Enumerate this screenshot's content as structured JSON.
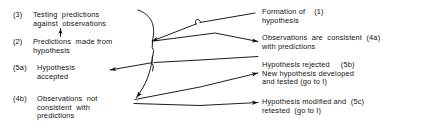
{
  "diagram": {
    "style": "hand-drawn line diagram, black ink on white",
    "colors": {
      "ink": "#111111",
      "background": "#ffffff"
    },
    "left_column": [
      {
        "tag": "(3)",
        "lines": [
          "Testing  predictions",
          "against  observations"
        ]
      },
      {
        "tag": "(2)",
        "lines": [
          "Predictions  made from",
          "hypothesis"
        ]
      },
      {
        "tag": "(5a)",
        "lines": [
          "Hypothesis",
          "accepted"
        ]
      },
      {
        "tag": "(4b)",
        "lines": [
          "Observations  not",
          "consistent  with",
          "predictions"
        ]
      }
    ],
    "right_column": [
      {
        "lines": [
          "Formation of",
          "hypothesis"
        ],
        "tag": "(1)"
      },
      {
        "lines": [
          "Observations  are  consistent",
          "with predictions"
        ],
        "tag": "(4a)"
      },
      {
        "lines": [
          "Hypothesis rejected",
          "New hypothesis developed",
          "and tested (go to I)"
        ],
        "tag": "(5b)"
      },
      {
        "lines": [
          "Hypothesis modified and",
          "retested  (go to I)"
        ],
        "tag": "(5c)"
      }
    ],
    "connectors": [
      {
        "name": "formation-to-predictions",
        "from": "(1) Formation of hypothesis",
        "to": "(2) Predictions made from hypothesis"
      },
      {
        "name": "predictions-to-testing",
        "from": "(2) Predictions made from hypothesis",
        "to": "(3) Testing predictions against observations"
      },
      {
        "name": "testing-to-consistent",
        "from": "(3) Testing predictions against observations",
        "to": "(4a) Observations are consistent with predictions"
      },
      {
        "name": "consistent-to-accepted",
        "from": "(4a) Observations are consistent with predictions",
        "to": "(5a) Hypothesis accepted"
      },
      {
        "name": "testing-to-not-consistent",
        "from": "(3) Testing predictions against observations",
        "to": "(4b) Observations not consistent with predictions"
      },
      {
        "name": "not-consistent-to-rejected",
        "from": "(4b) Observations not consistent with predictions",
        "to": "(5b) Hypothesis rejected / new hypothesis"
      },
      {
        "name": "not-consistent-to-modified",
        "from": "(4b) Observations not consistent with predictions",
        "to": "(5c) Hypothesis modified and retested"
      }
    ]
  }
}
